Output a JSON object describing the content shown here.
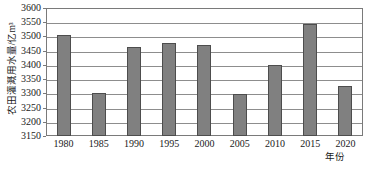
{
  "chart_data": {
    "type": "bar",
    "title": "",
    "subtitle": "",
    "xlabel": "年份",
    "ylabel": "农田灌溉用水量/亿m³",
    "categories": [
      "1980",
      "1985",
      "1990",
      "1995",
      "2000",
      "2005",
      "2010",
      "2015",
      "2020"
    ],
    "values": [
      3505,
      3300,
      3462,
      3478,
      3470,
      3297,
      3398,
      3543,
      3325
    ],
    "series": [
      {
        "name": "农田灌溉用水量",
        "values": [
          3505,
          3300,
          3462,
          3478,
          3470,
          3297,
          3398,
          3543,
          3325
        ]
      }
    ],
    "ylim": [
      3150,
      3600
    ],
    "ytick_values": [
      3150,
      3200,
      3250,
      3300,
      3350,
      3400,
      3450,
      3500,
      3550,
      3600
    ],
    "ytick_labels": [
      "3150",
      "3200",
      "3250",
      "3300",
      "3350",
      "3400",
      "3450",
      "3500",
      "3550",
      "3600"
    ],
    "xtick_labels": [
      "1980",
      "1985",
      "1990",
      "1995",
      "2000",
      "2005",
      "2010",
      "2015",
      "2020"
    ],
    "grid": "horizontal",
    "legend": "none",
    "bar_color": "#808080",
    "bar_edge_color": "#4d4d4d",
    "grid_color": "#8d8d8d",
    "frame_color": "#7a7a7a",
    "background": "#ffffff",
    "annotations": []
  }
}
